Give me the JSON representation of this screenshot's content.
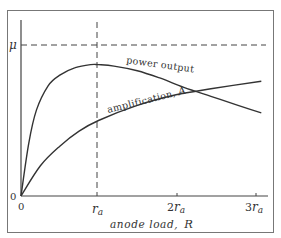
{
  "chart_data": {
    "type": "line",
    "title": "",
    "xlabel": "anode load, R",
    "ylabel": "",
    "x_ticks": [
      "0",
      "r_a",
      "2r_a",
      "3r_a"
    ],
    "x_tick_values": [
      0,
      1,
      2,
      3
    ],
    "y_ticks": [
      "0",
      "μ"
    ],
    "y_tick_values": [
      0,
      1
    ],
    "xlim": [
      0,
      3.15
    ],
    "ylim": [
      0,
      1.15
    ],
    "grid": false,
    "legend": "inline labels",
    "reference_lines": [
      {
        "orientation": "horizontal",
        "value": 1,
        "label": "μ",
        "style": "dashed"
      },
      {
        "orientation": "vertical",
        "value": 1,
        "label": "r_a",
        "style": "dashed"
      }
    ],
    "series": [
      {
        "name": "power output",
        "x": [
          0,
          0.1,
          0.2,
          0.35,
          0.5,
          0.7,
          0.9,
          1.0,
          1.2,
          1.5,
          1.8,
          2.1,
          2.45,
          2.8,
          3.1
        ],
        "y": [
          0,
          0.35,
          0.57,
          0.73,
          0.8,
          0.85,
          0.87,
          0.87,
          0.86,
          0.83,
          0.78,
          0.72,
          0.66,
          0.6,
          0.55
        ]
      },
      {
        "name": "amplification, A",
        "x": [
          0,
          0.25,
          0.5,
          0.75,
          1.0,
          1.5,
          2.0,
          2.45,
          3.1
        ],
        "y": [
          0,
          0.2,
          0.33,
          0.43,
          0.5,
          0.6,
          0.67,
          0.71,
          0.76
        ]
      }
    ],
    "annotations": [
      "power output",
      "amplification, A"
    ]
  },
  "labels": {
    "origin_y": "0",
    "origin_x": "0",
    "mu": "μ",
    "ra_r": "r",
    "ra_sub": "a",
    "two_ra_num": "2",
    "three_ra_num": "3",
    "xlabel_text": "anode load,",
    "xlabel_var": "R",
    "power_label": "power output",
    "amp_label": "amplification,",
    "amp_var": "A"
  }
}
